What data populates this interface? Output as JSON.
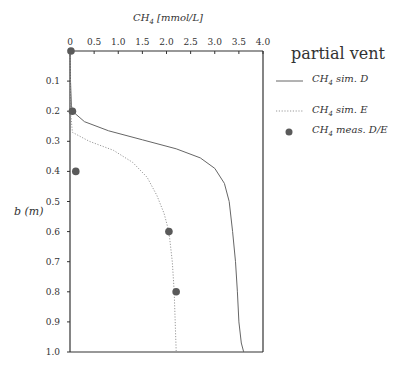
{
  "chart_data": {
    "type": "line",
    "title": "",
    "xlabel": "CH4 [mmol/L]",
    "ylabel": "b (m)",
    "xlim": [
      0,
      4.0
    ],
    "ylim": [
      0,
      1.0
    ],
    "y_inverted": true,
    "x_axis_position": "top",
    "grid": false,
    "legend_position": "right",
    "legend_title": "partial vent",
    "x_ticks": [
      "0",
      "0.5",
      "1.0",
      "1.5",
      "2.0",
      "2.5",
      "3.0",
      "3.5",
      "4.0"
    ],
    "y_ticks": [
      "0.1",
      "0.2",
      "0.3",
      "0.4",
      "0.5",
      "0.6",
      "0.7",
      "0.8",
      "0.9",
      "1.0"
    ],
    "series": [
      {
        "name": "CH4 sim. D",
        "style": "solid",
        "points": [
          [
            0,
            0
          ],
          [
            0.01,
            0.1
          ],
          [
            0.03,
            0.18
          ],
          [
            0.05,
            0.2
          ],
          [
            0.3,
            0.235
          ],
          [
            0.8,
            0.265
          ],
          [
            1.5,
            0.295
          ],
          [
            2.2,
            0.325
          ],
          [
            2.7,
            0.355
          ],
          [
            3.0,
            0.39
          ],
          [
            3.2,
            0.44
          ],
          [
            3.3,
            0.5
          ],
          [
            3.37,
            0.6
          ],
          [
            3.43,
            0.7
          ],
          [
            3.47,
            0.8
          ],
          [
            3.5,
            0.9
          ],
          [
            3.55,
            0.97
          ],
          [
            3.6,
            1.0
          ]
        ]
      },
      {
        "name": "CH4 sim. E",
        "style": "dotted",
        "points": [
          [
            0,
            0
          ],
          [
            0.01,
            0.2
          ],
          [
            0.05,
            0.27
          ],
          [
            0.4,
            0.3
          ],
          [
            0.9,
            0.33
          ],
          [
            1.3,
            0.37
          ],
          [
            1.6,
            0.42
          ],
          [
            1.8,
            0.48
          ],
          [
            1.95,
            0.54
          ],
          [
            2.05,
            0.6
          ],
          [
            2.12,
            0.7
          ],
          [
            2.16,
            0.8
          ],
          [
            2.18,
            0.9
          ],
          [
            2.2,
            1.0
          ]
        ]
      },
      {
        "name": "CH4 meas. D/E",
        "style": "marker",
        "points": [
          [
            0.02,
            0.0
          ],
          [
            0.05,
            0.2
          ],
          [
            0.12,
            0.4
          ],
          [
            2.05,
            0.6
          ],
          [
            2.2,
            0.8
          ]
        ]
      }
    ]
  },
  "labels": {
    "x_title_main": "CH",
    "x_title_sub": "4",
    "x_title_rest": " [mmol/L]",
    "y_title": "b (m)",
    "legend_title": "partial vent",
    "legend": [
      {
        "main": "CH",
        "sub": "4",
        "rest": " sim. D"
      },
      {
        "main": "CH",
        "sub": "4",
        "rest": " sim. E"
      },
      {
        "main": "CH",
        "sub": "4",
        "rest": " meas. D/E"
      }
    ]
  },
  "colors": {
    "axis": "#333333",
    "sim_d": "#666666",
    "sim_e": "#999999",
    "marker": "#5a5a5a"
  }
}
